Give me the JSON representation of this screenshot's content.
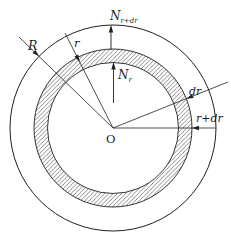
{
  "figure": {
    "labels": {
      "outer_radius": "R",
      "ring_radius": "r",
      "center": "O",
      "thickness": "dr",
      "ring_outer_radius": "r+dr",
      "force_inner_main": "N",
      "force_inner_sub": "r",
      "force_outer_main": "N",
      "force_outer_sub": "r+dr"
    },
    "colors": {
      "stroke": "#1f1f1f",
      "background": "#ffffff"
    }
  }
}
